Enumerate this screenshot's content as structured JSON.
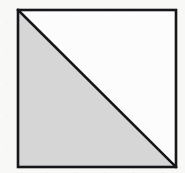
{
  "figure": {
    "canvas": {
      "width": 185,
      "height": 173,
      "background_color": "#f8f8f6"
    },
    "square": {
      "name": "square outline",
      "x": 18,
      "y": 10,
      "width": 158,
      "height": 157,
      "stroke_color": "#16161a",
      "stroke_width": 2.6,
      "fill_color": "#ffffff"
    },
    "diagonal": {
      "name": "diagonal from top-left corner to bottom-right corner",
      "x1": 18,
      "y1": 10,
      "x2": 176,
      "y2": 167,
      "stroke_color": "#16161a",
      "stroke_width": 2.6
    },
    "shaded_triangle": {
      "name": "lower-left shaded half",
      "points": "18,10 18,167 176,167",
      "fill_color": "#d6d6d6",
      "region": "below-left of diagonal"
    },
    "unshaded_triangle": {
      "name": "upper-right unshaded half",
      "points": "18,10 176,10 176,167",
      "fill_color": "#fcfcfc",
      "region": "above-right of diagonal"
    }
  }
}
